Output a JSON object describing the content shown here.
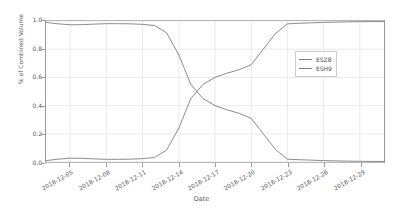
{
  "chart_data": {
    "type": "line",
    "title": "",
    "xlabel": "Date",
    "ylabel": "% of Combined Volume",
    "grid": true,
    "legend_position": "center right (inside axes)",
    "xlim": [
      "2018-12-03",
      "2018-12-31"
    ],
    "ylim": [
      0.0,
      1.0
    ],
    "ytick_labels": [
      "0.0",
      "0.2",
      "0.4",
      "0.6",
      "0.8",
      "1.0"
    ],
    "ytick_values": [
      0.0,
      0.2,
      0.4,
      0.6,
      0.8,
      1.0
    ],
    "xtick_labels": [
      "2018-12-05",
      "2018-12-08",
      "2018-12-11",
      "2018-12-14",
      "2018-12-17",
      "2018-12-20",
      "2018-12-23",
      "2018-12-26",
      "2018-12-29"
    ],
    "x": [
      "2018-12-03",
      "2018-12-04",
      "2018-12-05",
      "2018-12-06",
      "2018-12-07",
      "2018-12-08",
      "2018-12-09",
      "2018-12-10",
      "2018-12-11",
      "2018-12-12",
      "2018-12-13",
      "2018-12-14",
      "2018-12-15",
      "2018-12-16",
      "2018-12-17",
      "2018-12-18",
      "2018-12-19",
      "2018-12-20",
      "2018-12-21",
      "2018-12-22",
      "2018-12-23",
      "2018-12-24",
      "2018-12-25",
      "2018-12-26",
      "2018-12-27",
      "2018-12-28",
      "2018-12-29",
      "2018-12-30",
      "2018-12-31"
    ],
    "series": [
      {
        "name": "ESZ8",
        "color": "#7f7f7f",
        "values": [
          0.99,
          0.98,
          0.973,
          0.974,
          0.978,
          0.981,
          0.981,
          0.98,
          0.976,
          0.968,
          0.915,
          0.76,
          0.55,
          0.45,
          0.4,
          0.37,
          0.345,
          0.31,
          0.2,
          0.09,
          0.02,
          0.016,
          0.013,
          0.01,
          0.008,
          0.006,
          0.005,
          0.004,
          0.004
        ]
      },
      {
        "name": "ESH9",
        "color": "#7f7f7f",
        "values": [
          0.01,
          0.02,
          0.027,
          0.026,
          0.022,
          0.019,
          0.019,
          0.02,
          0.024,
          0.032,
          0.085,
          0.24,
          0.45,
          0.55,
          0.6,
          0.63,
          0.655,
          0.69,
          0.8,
          0.91,
          0.98,
          0.984,
          0.987,
          0.99,
          0.992,
          0.994,
          0.995,
          0.996,
          0.996
        ]
      }
    ]
  },
  "legend": {
    "items": [
      {
        "label": "ESZ8"
      },
      {
        "label": "ESH9"
      }
    ]
  }
}
